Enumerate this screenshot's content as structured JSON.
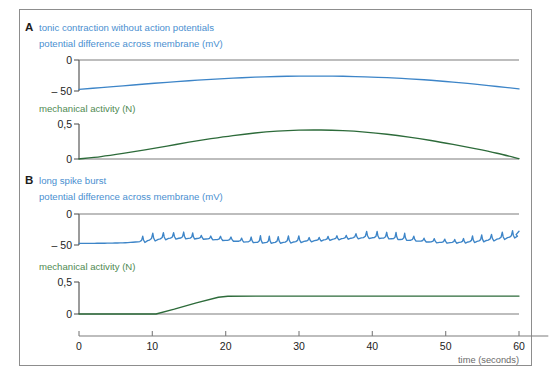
{
  "figure": {
    "background": "#ffffff",
    "border_color": "#8d8d8d",
    "blue": "#3d85c8",
    "green": "#2d6b3a",
    "label_blue": "#4a8fd0",
    "label_green": "#4f8a52",
    "axis_color": "#7c7c7c"
  },
  "panels": [
    {
      "letter": "A",
      "title": "tonic contraction without action potentials",
      "membrane_label": "potential difference across membrane (mV)",
      "mechanical_label": "mechanical activity (N)",
      "membrane_ticks": [
        "0",
        "– 50"
      ],
      "mechanical_ticks": [
        "0,5",
        "0"
      ]
    },
    {
      "letter": "B",
      "title": "long spike burst",
      "membrane_label": "potential difference across membrane (mV)",
      "mechanical_label": "mechanical activity (N)",
      "membrane_ticks": [
        "0",
        "– 50"
      ],
      "mechanical_ticks": [
        "0,5",
        "0"
      ]
    }
  ],
  "xaxis": {
    "caption": "time (seconds)",
    "ticks": [
      "0",
      "10",
      "20",
      "30",
      "40",
      "50",
      "60"
    ],
    "values": [
      0,
      10,
      20,
      30,
      40,
      50,
      60
    ],
    "min": 0,
    "max": 60,
    "overrun": 4
  },
  "chart_data": {
    "type": "line",
    "xlabel": "time (seconds)",
    "xlim": [
      0,
      60
    ],
    "grid": false,
    "legend": "none",
    "panels": [
      {
        "name": "A",
        "label": "tonic contraction without action potentials",
        "series": [
          {
            "name": "potential difference across membrane",
            "ylabel": "potential difference across membrane (mV)",
            "units": "mV",
            "color": "#3d85c8",
            "ylim": [
              -55,
              0
            ],
            "yticks": [
              0,
              -50
            ],
            "x": [
              0,
              3,
              6,
              9,
              12,
              15,
              18,
              21,
              24,
              27,
              30,
              33,
              36,
              39,
              42,
              45,
              48,
              51,
              54,
              57,
              60
            ],
            "y": [
              -52.0,
              -49.0,
              -45.8,
              -42.6,
              -39.6,
              -36.8,
              -34.3,
              -32.2,
              -30.5,
              -29.3,
              -28.6,
              -28.5,
              -28.9,
              -29.9,
              -31.4,
              -33.4,
              -36.0,
              -39.2,
              -42.9,
              -47.0,
              -51.3
            ]
          },
          {
            "name": "mechanical activity",
            "ylabel": "mechanical activity (N)",
            "units": "N",
            "color": "#2d6b3a",
            "ylim": [
              0,
              0.5
            ],
            "yticks": [
              0.5,
              0
            ],
            "x": [
              0,
              3,
              6,
              9,
              12,
              15,
              18,
              21,
              24,
              27,
              30,
              33,
              36,
              39,
              42,
              45,
              48,
              51,
              54,
              57,
              60
            ],
            "y": [
              0.0,
              0.035,
              0.08,
              0.13,
              0.185,
              0.24,
              0.29,
              0.335,
              0.372,
              0.398,
              0.412,
              0.414,
              0.405,
              0.385,
              0.354,
              0.313,
              0.264,
              0.208,
              0.148,
              0.082,
              0.005
            ]
          }
        ]
      },
      {
        "name": "B",
        "label": "long spike burst",
        "series": [
          {
            "name": "potential difference across membrane",
            "ylabel": "potential difference across membrane (mV)",
            "units": "mV",
            "color": "#3d85c8",
            "ylim": [
              -55,
              0
            ],
            "yticks": [
              0,
              -50
            ],
            "description": "flat baseline near -52 mV until about 8 s, then a long burst of sharp spikes riding on a slowly undulating baseline, ending near -25 mV at 60 s",
            "baseline_x": [
              0,
              2,
              4,
              6,
              8,
              10,
              12,
              14,
              16,
              18,
              20,
              22,
              24,
              26,
              28,
              30,
              32,
              34,
              36,
              38,
              40,
              42,
              44,
              46,
              48,
              50,
              52,
              54,
              56,
              58,
              60
            ],
            "baseline_y": [
              -52.0,
              -52.0,
              -51.8,
              -51.2,
              -49.5,
              -45.5,
              -43.0,
              -42.5,
              -43.0,
              -44.5,
              -46.5,
              -48.5,
              -50.0,
              -50.5,
              -50.0,
              -48.8,
              -47.0,
              -45.0,
              -43.2,
              -42.0,
              -41.8,
              -42.8,
              -45.0,
              -47.5,
              -49.5,
              -50.5,
              -50.0,
              -48.5,
              -46.0,
              -42.5,
              -38.5
            ],
            "spike_start": 8.3,
            "spike_end": 59.4,
            "spike_interval": 1.32,
            "spike_amplitude": 11.5
          },
          {
            "name": "mechanical activity",
            "ylabel": "mechanical activity (N)",
            "units": "N",
            "color": "#2d6b3a",
            "ylim": [
              0,
              0.5
            ],
            "yticks": [
              0.5,
              0
            ],
            "description": "flat at 0 N until about 10.5 s, rises linearly to a plateau of about 0.28 N at 20 s and is maintained to 60 s",
            "x": [
              0,
              10.5,
              13,
              16,
              19,
              20.3,
              30,
              40,
              50,
              60
            ],
            "y": [
              0.0,
              0.0,
              0.075,
              0.175,
              0.262,
              0.278,
              0.279,
              0.28,
              0.28,
              0.28
            ]
          }
        ]
      }
    ]
  }
}
